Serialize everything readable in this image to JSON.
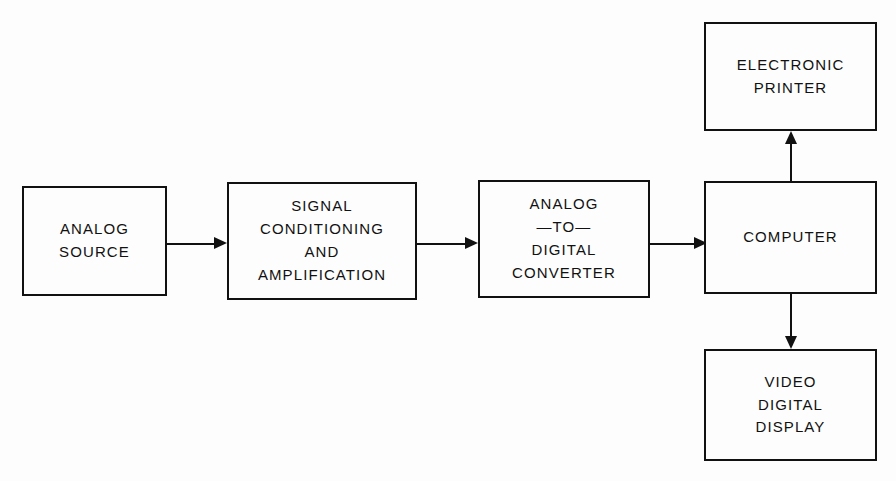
{
  "diagram": {
    "kind": "block-diagram",
    "background_color": "#fdfdfd",
    "stroke_color": "#111111",
    "text_color": "#111111",
    "blocks": [
      {
        "id": "analog-source",
        "lines": [
          "ANALOG",
          "SOURCE"
        ],
        "x": 22,
        "y": 186,
        "width": 145,
        "height": 110
      },
      {
        "id": "signal-conditioning",
        "lines": [
          "SIGNAL",
          "CONDITIONING",
          "AND",
          "AMPLIFICATION"
        ],
        "x": 227,
        "y": 182,
        "width": 190,
        "height": 118
      },
      {
        "id": "analog-to-digital-converter",
        "lines": [
          "ANALOG",
          "—TO—",
          "DIGITAL",
          "CONVERTER"
        ],
        "x": 478,
        "y": 180,
        "width": 172,
        "height": 118
      },
      {
        "id": "computer",
        "lines": [
          "COMPUTER"
        ],
        "x": 704,
        "y": 181,
        "width": 173,
        "height": 113
      },
      {
        "id": "electronic-printer",
        "lines": [
          "ELECTRONIC",
          "PRINTER"
        ],
        "x": 704,
        "y": 22,
        "width": 173,
        "height": 109
      },
      {
        "id": "video-digital-display",
        "lines": [
          "VIDEO",
          "DIGITAL",
          "DISPLAY"
        ],
        "x": 704,
        "y": 349,
        "width": 173,
        "height": 112
      }
    ],
    "connectors": [
      {
        "id": "source-to-conditioning",
        "from": "analog-source",
        "to": "signal-conditioning",
        "direction": "right"
      },
      {
        "id": "conditioning-to-adc",
        "from": "signal-conditioning",
        "to": "analog-to-digital-converter",
        "direction": "right"
      },
      {
        "id": "adc-to-computer",
        "from": "analog-to-digital-converter",
        "to": "computer",
        "direction": "right"
      },
      {
        "id": "computer-to-printer",
        "from": "computer",
        "to": "electronic-printer",
        "direction": "up"
      },
      {
        "id": "computer-to-display",
        "from": "computer",
        "to": "video-digital-display",
        "direction": "down"
      }
    ]
  }
}
